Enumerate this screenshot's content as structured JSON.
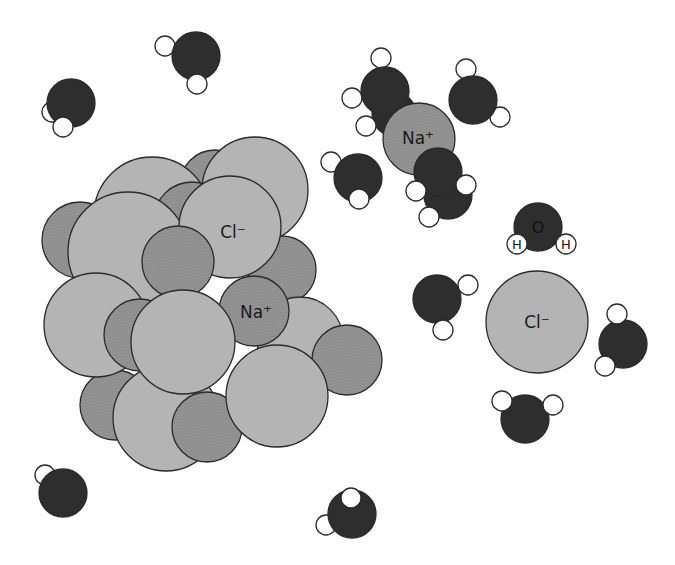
{
  "diagram": {
    "colors": {
      "background": "#ffffff",
      "chloride": "#b4b4b4",
      "sodium": "#8f8f8f",
      "oxygen": "#2e2e2e",
      "hydrogen": "#ffffff",
      "outline": "#2a2a2a"
    },
    "labels": {
      "crystal_chloride": "Cl⁻",
      "crystal_sodium": "Na⁺",
      "solvated_sodium": "Na⁺",
      "solvated_chloride": "Cl⁻",
      "water_oxygen": "O",
      "water_hydrogen_left": "H",
      "water_hydrogen_right": "H"
    }
  }
}
